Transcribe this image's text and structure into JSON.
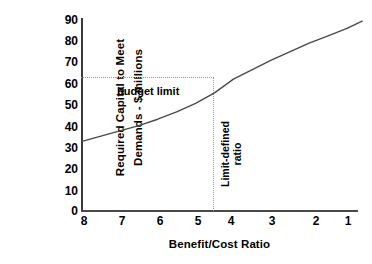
{
  "chart_data": {
    "type": "line",
    "title": "",
    "xlabel": "Benefit/Cost Ratio",
    "ylabel_line1": "Required Capital to Meet",
    "ylabel_line2": "Demands - $ millions",
    "xticks": [
      "8",
      "7",
      "6",
      "5",
      "4",
      "3",
      "2",
      "1"
    ],
    "xtick_values": [
      8,
      7,
      6,
      5,
      4,
      3,
      2,
      1
    ],
    "yticks": [
      "0",
      "10",
      "20",
      "30",
      "40",
      "50",
      "60",
      "70",
      "80",
      "90"
    ],
    "ytick_values": [
      0,
      10,
      20,
      30,
      40,
      50,
      60,
      70,
      80,
      90
    ],
    "xlim": [
      8,
      0.6
    ],
    "ylim": [
      0,
      95
    ],
    "x_axis_reversed": true,
    "grid": false,
    "legend": false,
    "series": [
      {
        "name": "Required capital",
        "x": [
          8.0,
          7.5,
          7.0,
          6.5,
          6.0,
          5.5,
          5.0,
          4.5,
          4.0,
          3.5,
          3.0,
          2.5,
          2.0,
          1.5,
          1.0,
          0.6
        ],
        "values": [
          32.5,
          35.0,
          37.5,
          40.0,
          43.0,
          46.5,
          50.5,
          55.5,
          62.0,
          66.5,
          71.0,
          75.0,
          79.0,
          82.5,
          86.0,
          89.5
        ]
      }
    ],
    "annotations": [
      {
        "name": "budget-limit",
        "label": "budget limit",
        "type": "horizontal-reference",
        "y_value": 63
      },
      {
        "name": "limit-defined-ratio",
        "label_line1": "Limit-defined",
        "label_line2": "ratio",
        "type": "vertical-reference",
        "x_value": 4.4
      }
    ],
    "colors": {
      "curve": "#4a4a4a",
      "axis": "#3b3b3b",
      "guide": "#9a9a9a",
      "text": "#000000",
      "background": "#ffffff"
    }
  }
}
